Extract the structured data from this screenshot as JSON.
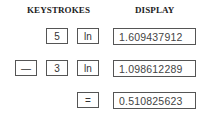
{
  "headers": {
    "keystrokes": "KEYSTROKES",
    "display": "DISPLAY"
  },
  "rows": [
    {
      "keys": [
        "5",
        "ln"
      ],
      "display": "1.609437912"
    },
    {
      "keys": [
        "—",
        "3",
        "ln"
      ],
      "display": "1.098612289"
    },
    {
      "keys": [
        "="
      ],
      "display": "0.510825623"
    }
  ]
}
